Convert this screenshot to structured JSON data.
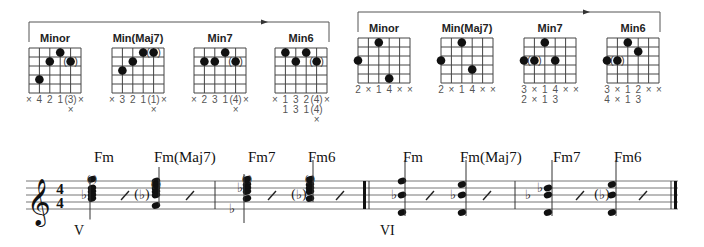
{
  "brackets": [
    {
      "id": "group-1",
      "x1": 29,
      "x2": 329,
      "y": 22,
      "left_drop": 42,
      "right_drop": 42,
      "arrow_x": 265
    },
    {
      "id": "group-2",
      "x1": 358,
      "x2": 660,
      "y": 12,
      "left_drop": 32,
      "right_drop": 32,
      "arrow_x": 587
    }
  ],
  "chord_diagrams": [
    {
      "title": "Minor",
      "x": 29,
      "y": 48,
      "strings": 6,
      "frets": 5,
      "dots": [
        {
          "s": 1,
          "f": 4,
          "paren": false
        },
        {
          "s": 2,
          "f": 2,
          "paren": false
        },
        {
          "s": 3,
          "f": 1,
          "paren": false
        },
        {
          "s": 4,
          "f": 2,
          "paren": true
        }
      ],
      "fingers": [
        "×",
        "4",
        "2",
        "1",
        "(3)",
        "×"
      ],
      "fingers2": [
        "",
        "",
        "",
        "",
        "×",
        ""
      ]
    },
    {
      "title": "Min(Maj7)",
      "x": 112,
      "y": 48,
      "strings": 6,
      "frets": 5,
      "dots": [
        {
          "s": 1,
          "f": 3,
          "paren": false
        },
        {
          "s": 2,
          "f": 2,
          "paren": false
        },
        {
          "s": 3,
          "f": 1,
          "paren": false
        },
        {
          "s": 4,
          "f": 1,
          "paren": true
        }
      ],
      "fingers": [
        "×",
        "3",
        "2",
        "1",
        "(1)",
        "×"
      ],
      "fingers2": [
        "",
        "",
        "",
        "",
        "×",
        ""
      ]
    },
    {
      "title": "Min7",
      "x": 194,
      "y": 48,
      "strings": 6,
      "frets": 5,
      "dots": [
        {
          "s": 1,
          "f": 2,
          "paren": false
        },
        {
          "s": 2,
          "f": 2,
          "paren": false
        },
        {
          "s": 3,
          "f": 1,
          "paren": false
        },
        {
          "s": 4,
          "f": 2,
          "paren": true
        }
      ],
      "fingers": [
        "×",
        "2",
        "3",
        "1",
        "(4)",
        "×"
      ],
      "fingers2": [
        "",
        "",
        "",
        "",
        "×",
        ""
      ]
    },
    {
      "title": "Min6",
      "x": 275,
      "y": 48,
      "strings": 6,
      "frets": 5,
      "dots": [
        {
          "s": 1,
          "f": 1,
          "paren": false
        },
        {
          "s": 2,
          "f": 2,
          "paren": false
        },
        {
          "s": 3,
          "f": 1,
          "paren": false
        },
        {
          "s": 4,
          "f": 2,
          "paren": true
        }
      ],
      "fingers": [
        "×",
        "1",
        "3",
        "2",
        "(4)",
        "×"
      ],
      "fingers2": [
        "",
        "1",
        "3",
        "1",
        "(4)",
        ""
      ],
      "fingers3": [
        "",
        "",
        "",
        "",
        "×",
        ""
      ]
    },
    {
      "title": "Minor",
      "x": 358,
      "y": 38,
      "strings": 6,
      "frets": 5,
      "dots": [
        {
          "s": 0,
          "f": 3,
          "paren": false
        },
        {
          "s": 2,
          "f": 1,
          "paren": false
        },
        {
          "s": 3,
          "f": 5,
          "paren": false
        }
      ],
      "fingers": [
        "2",
        "×",
        "1",
        "4",
        "×",
        "×"
      ]
    },
    {
      "title": "Min(Maj7)",
      "x": 441,
      "y": 38,
      "strings": 6,
      "frets": 5,
      "dots": [
        {
          "s": 0,
          "f": 3,
          "paren": false
        },
        {
          "s": 2,
          "f": 1,
          "paren": false
        },
        {
          "s": 3,
          "f": 4,
          "paren": false
        }
      ],
      "fingers": [
        "2",
        "×",
        "1",
        "4",
        "×",
        "×"
      ]
    },
    {
      "title": "Min7",
      "x": 524,
      "y": 38,
      "strings": 6,
      "frets": 5,
      "dots": [
        {
          "s": 0,
          "f": 3,
          "paren": false
        },
        {
          "s": 1,
          "f": 3,
          "paren": true
        },
        {
          "s": 2,
          "f": 1,
          "paren": false
        },
        {
          "s": 3,
          "f": 3,
          "paren": false
        }
      ],
      "fingers": [
        "3",
        "×",
        "1",
        "4",
        "×",
        "×"
      ],
      "fingers2": [
        "2",
        "×",
        "1",
        "3",
        "",
        ""
      ]
    },
    {
      "title": "Min6",
      "x": 607,
      "y": 38,
      "strings": 6,
      "frets": 5,
      "dots": [
        {
          "s": 0,
          "f": 3,
          "paren": false
        },
        {
          "s": 1,
          "f": 3,
          "paren": true
        },
        {
          "s": 2,
          "f": 1,
          "paren": false
        },
        {
          "s": 3,
          "f": 2,
          "paren": false
        }
      ],
      "fingers": [
        "3",
        "×",
        "1",
        "2",
        "×",
        "×"
      ],
      "fingers2": [
        "4",
        "×",
        "1",
        "3",
        "",
        ""
      ]
    }
  ],
  "staff": {
    "x1": 26,
    "x2": 678,
    "top": 181,
    "spacing": 7,
    "clef": "treble",
    "time_signature": {
      "top": "4",
      "bottom": "4"
    },
    "chord_symbols": [
      {
        "label": "Fm",
        "x": 94
      },
      {
        "label": "Fm(Maj7)",
        "x": 154
      },
      {
        "label": "Fm7",
        "x": 248
      },
      {
        "label": "Fm6",
        "x": 308
      },
      {
        "label": "Fm",
        "x": 403
      },
      {
        "label": "Fm(Maj7)",
        "x": 460
      },
      {
        "label": "Fm7",
        "x": 553
      },
      {
        "label": "Fm6",
        "x": 614
      }
    ],
    "position_labels": [
      {
        "label": "V",
        "x": 74,
        "y": 235
      },
      {
        "label": "VI",
        "x": 380,
        "y": 235
      }
    ],
    "barlines": [
      {
        "x": 215,
        "type": "single"
      },
      {
        "x": 367,
        "type": "heavy-double"
      },
      {
        "x": 515,
        "type": "single"
      },
      {
        "x": 676,
        "type": "final"
      }
    ]
  }
}
